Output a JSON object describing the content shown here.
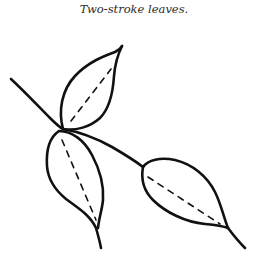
{
  "caption": "Two-stroke leaves.",
  "illustration": {
    "subject": "branch with three two-stroke leaves",
    "stroke_color": "#111111",
    "background": "#ffffff",
    "leaves": [
      {
        "name": "top-leaf",
        "vein": "dashed"
      },
      {
        "name": "lower-left-leaf",
        "vein": "dashed"
      },
      {
        "name": "right-leaf",
        "vein": "dashed"
      }
    ]
  }
}
